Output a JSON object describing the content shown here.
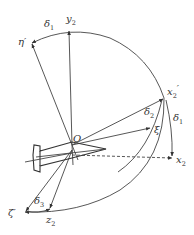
{
  "diagram": {
    "title": "",
    "colors": {
      "stroke": "#444444",
      "text": "#333333",
      "background": "#ffffff"
    },
    "origin": {
      "label": "O"
    },
    "axes": [
      {
        "id": "y2",
        "label": "y",
        "sub": "2"
      },
      {
        "id": "eta_prime",
        "label": "η′",
        "sub": ""
      },
      {
        "id": "x2_prime",
        "label": "x",
        "sub": "2",
        "prime": "′"
      },
      {
        "id": "x2",
        "label": "x",
        "sub": "2"
      },
      {
        "id": "xi",
        "label": "ξ",
        "sub": ""
      },
      {
        "id": "z2",
        "label": "z",
        "sub": "2"
      },
      {
        "id": "zeta_prime",
        "label": "ζ′",
        "sub": ""
      }
    ],
    "angles": [
      {
        "id": "delta1_top",
        "label": "δ",
        "sub": "1"
      },
      {
        "id": "delta1_right",
        "label": "δ",
        "sub": "1"
      },
      {
        "id": "delta2",
        "label": "δ",
        "sub": "2"
      },
      {
        "id": "delta3",
        "label": "δ",
        "sub": "3"
      }
    ]
  }
}
